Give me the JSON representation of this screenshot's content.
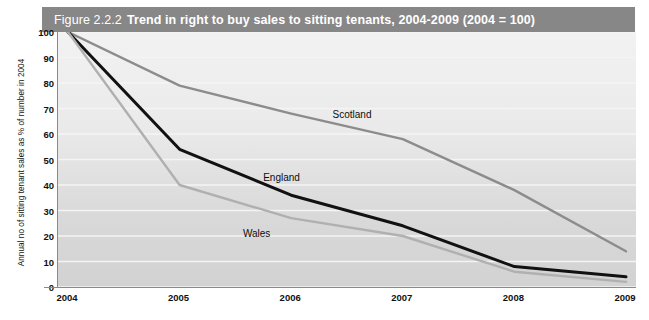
{
  "title": {
    "figure_number": "Figure 2.2.2",
    "text": "Trend in right to buy sales to sitting tenants, 2004-2009 (2004 = 100)",
    "bar_color": "#878787"
  },
  "chart_data": {
    "type": "line",
    "title": "Trend in right to buy sales to sitting tenants, 2004-2009 (2004 = 100)",
    "xlabel": "",
    "ylabel": "Annual no of sitting tenant sales as % of number in 2004",
    "categories": [
      "2004",
      "2005",
      "2006",
      "2007",
      "2008",
      "2009"
    ],
    "x_tick_labels": [
      "2004",
      "2005",
      "2006",
      "2007",
      "2008",
      "2009"
    ],
    "y_tick_labels": [
      "100",
      "90",
      "80",
      "70",
      "60",
      "50",
      "40",
      "30",
      "20",
      "10",
      "0"
    ],
    "ylim": [
      0,
      100
    ],
    "y_tick_step": 10,
    "grid": true,
    "legend_position": "inline-labels",
    "series": [
      {
        "name": "Scotland",
        "color": "#8c8c8c",
        "values": [
          100,
          79,
          68,
          58,
          38,
          14
        ],
        "label_x_pct": 47.5,
        "label_y_pct": 30.0
      },
      {
        "name": "England",
        "color": "#111111",
        "values": [
          100,
          54,
          36,
          24,
          8,
          4
        ],
        "label_x_pct": 35.5,
        "label_y_pct": 55.0
      },
      {
        "name": "Wales",
        "color": "#b0b0b0",
        "values": [
          100,
          40,
          27,
          20,
          6,
          2
        ],
        "label_x_pct": 32.0,
        "label_y_pct": 77.0
      }
    ]
  },
  "colors": {
    "title_bar": "#878787",
    "plot_background_top": "#f2f2f2",
    "plot_background_bottom": "#d2d2d2",
    "gridline": "#f4f4f4",
    "axis": "#8a8a8a"
  }
}
